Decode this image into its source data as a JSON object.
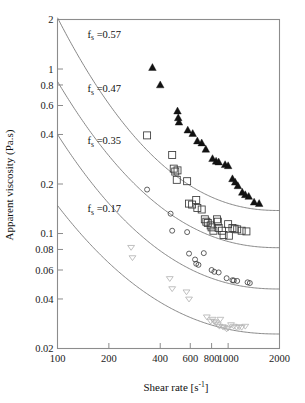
{
  "chart_data": {
    "type": "scatter",
    "title": "",
    "xlabel": "Shear rate [s-1]",
    "xlabel_base": "Shear rate [s",
    "xlabel_sup": "-1",
    "xlabel_tail": "]",
    "ylabel": "Apparent viscosity (Pa.s)",
    "xscale": "log",
    "yscale": "log",
    "xlim": [
      100,
      2000
    ],
    "ylim": [
      0.02,
      2
    ],
    "grid": false,
    "legend_position": "inline-annotations",
    "xticks": [
      100,
      200,
      400,
      600,
      800,
      1000,
      2000
    ],
    "xtick_labels": [
      "100",
      "200",
      "400",
      "600",
      "800",
      "1000",
      "2000"
    ],
    "yticks": [
      2,
      1,
      0.8,
      0.6,
      0.4,
      0.2,
      0.1,
      0.08,
      0.06,
      0.04,
      0.02
    ],
    "ytick_labels": [
      "2",
      "1",
      "0.8",
      "0.6",
      "0.4",
      "0.2",
      "0.1",
      "0.08",
      "0.06",
      "0.04",
      "0.02"
    ],
    "annotations": [
      {
        "id": "fs057",
        "text_prefix": "f",
        "text_sub": "s",
        "text_suffix": " =0.57",
        "x": 150,
        "y": 1.55
      },
      {
        "id": "fs047",
        "text_prefix": "f",
        "text_sub": "s",
        "text_suffix": " =0.47",
        "x": 150,
        "y": 0.72
      },
      {
        "id": "fs035",
        "text_prefix": "f",
        "text_sub": "s",
        "text_suffix": " =0.35",
        "x": 150,
        "y": 0.35
      },
      {
        "id": "fs017",
        "text_prefix": "f",
        "text_sub": "s",
        "text_suffix": " =0.17",
        "x": 150,
        "y": 0.135
      }
    ],
    "series": [
      {
        "name": "f_s =0.57",
        "marker": "filled-triangle-up",
        "color": "#121212",
        "fs": 0.57,
        "points": [
          [
            360,
            1.02
          ],
          [
            400,
            0.8
          ],
          [
            505,
            0.555
          ],
          [
            510,
            0.505
          ],
          [
            515,
            0.475
          ],
          [
            580,
            0.425
          ],
          [
            620,
            0.405
          ],
          [
            660,
            0.365
          ],
          [
            700,
            0.355
          ],
          [
            740,
            0.325
          ],
          [
            810,
            0.285
          ],
          [
            850,
            0.275
          ],
          [
            880,
            0.272
          ],
          [
            960,
            0.262
          ],
          [
            1000,
            0.258
          ],
          [
            1060,
            0.215
          ],
          [
            1100,
            0.205
          ],
          [
            1140,
            0.195
          ],
          [
            1210,
            0.178
          ],
          [
            1260,
            0.172
          ],
          [
            1320,
            0.168
          ],
          [
            1420,
            0.155
          ],
          [
            1520,
            0.152
          ]
        ]
      },
      {
        "name": "f_s =0.47",
        "marker": "open-square",
        "color": "#3a3a3a",
        "fs": 0.47,
        "points": [
          [
            335,
            0.395
          ],
          [
            470,
            0.3
          ],
          [
            480,
            0.248
          ],
          [
            490,
            0.238
          ],
          [
            505,
            0.242
          ],
          [
            500,
            0.212
          ],
          [
            575,
            0.208
          ],
          [
            590,
            0.152
          ],
          [
            615,
            0.15
          ],
          [
            650,
            0.16
          ],
          [
            660,
            0.143
          ],
          [
            700,
            0.14
          ],
          [
            730,
            0.122
          ],
          [
            745,
            0.118
          ],
          [
            760,
            0.116
          ],
          [
            790,
            0.112
          ],
          [
            800,
            0.109
          ],
          [
            820,
            0.104
          ],
          [
            860,
            0.122
          ],
          [
            870,
            0.118
          ],
          [
            880,
            0.108
          ],
          [
            920,
            0.104
          ],
          [
            940,
            0.098
          ],
          [
            1000,
            0.114
          ],
          [
            1010,
            0.097
          ],
          [
            1060,
            0.108
          ],
          [
            1090,
            0.107
          ],
          [
            1130,
            0.106
          ],
          [
            1200,
            0.104
          ],
          [
            1280,
            0.103
          ]
        ]
      },
      {
        "name": "f_s =0.35",
        "marker": "open-circle",
        "color": "#3a3a3a",
        "fs": 0.35,
        "points": [
          [
            335,
            0.185
          ],
          [
            460,
            0.132
          ],
          [
            470,
            0.104
          ],
          [
            575,
            0.102
          ],
          [
            590,
            0.0755
          ],
          [
            640,
            0.0695
          ],
          [
            650,
            0.0655
          ],
          [
            670,
            0.0645
          ],
          [
            720,
            0.076
          ],
          [
            800,
            0.06
          ],
          [
            830,
            0.0585
          ],
          [
            880,
            0.058
          ],
          [
            980,
            0.0535
          ],
          [
            1060,
            0.052
          ],
          [
            1080,
            0.0518
          ],
          [
            1130,
            0.0515
          ],
          [
            1300,
            0.0505
          ],
          [
            1340,
            0.05
          ]
        ]
      },
      {
        "name": "f_s =0.17",
        "marker": "open-triangle-down",
        "color": "#b5b5b5",
        "fs": 0.17,
        "points": [
          [
            270,
            0.082
          ],
          [
            275,
            0.071
          ],
          [
            455,
            0.053
          ],
          [
            470,
            0.046
          ],
          [
            570,
            0.044
          ],
          [
            590,
            0.0398
          ],
          [
            750,
            0.031
          ],
          [
            790,
            0.0292
          ],
          [
            810,
            0.03
          ],
          [
            830,
            0.029
          ],
          [
            850,
            0.0285
          ],
          [
            870,
            0.0278
          ],
          [
            890,
            0.0272
          ],
          [
            900,
            0.03
          ],
          [
            930,
            0.027
          ],
          [
            950,
            0.0268
          ],
          [
            980,
            0.0262
          ],
          [
            1000,
            0.0265
          ],
          [
            1040,
            0.0278
          ],
          [
            1080,
            0.0272
          ],
          [
            1120,
            0.0268
          ],
          [
            1160,
            0.027
          ],
          [
            1200,
            0.0268
          ],
          [
            1260,
            0.0272
          ]
        ]
      }
    ],
    "fit_curves": [
      {
        "series": "f_s =0.57",
        "x_start": 100,
        "x_end": 2000,
        "y_start": 2.05,
        "y_end": 0.138
      },
      {
        "series": "f_s =0.47",
        "x_start": 100,
        "x_end": 2000,
        "y_start": 0.84,
        "y_end": 0.082
      },
      {
        "series": "f_s =0.35",
        "x_start": 100,
        "x_end": 2000,
        "y_start": 0.4,
        "y_end": 0.046
      },
      {
        "series": "f_s =0.17",
        "x_start": 100,
        "x_end": 2000,
        "y_start": 0.148,
        "y_end": 0.0245
      }
    ]
  }
}
